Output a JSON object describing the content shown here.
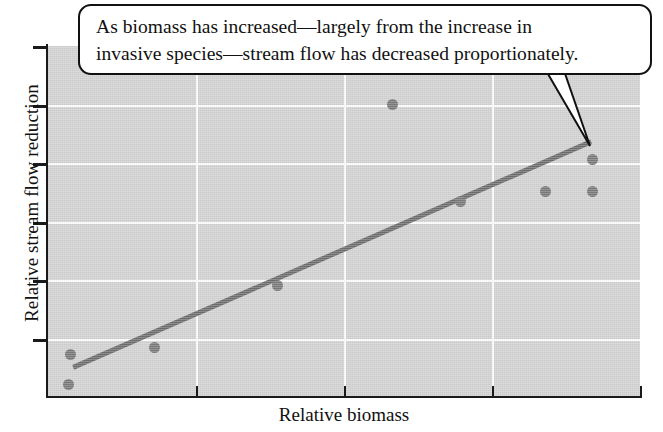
{
  "figure": {
    "callout": {
      "text": "As biomass has increased—largely from the increase in invasive species—stream flow has decreased proportionately.",
      "line1": "As biomass has increased—largely from the increase in",
      "line2": "invasive species—stream flow has decreased proportionately."
    }
  },
  "chart_data": {
    "type": "scatter",
    "title": "",
    "xlabel": "Relative biomass",
    "ylabel": "Relative stream flow reduction",
    "xlim": [
      0,
      4
    ],
    "ylim": [
      0,
      6
    ],
    "grid": true,
    "legend": null,
    "x_tick_values": [
      1,
      2,
      3
    ],
    "y_tick_values": [
      1,
      2,
      3,
      4,
      5
    ],
    "x_tick_labels": [
      "",
      "",
      ""
    ],
    "y_tick_labels": [
      "",
      "",
      "",
      "",
      ""
    ],
    "points": [
      {
        "x": 0.15,
        "y": 0.72
      },
      {
        "x": 0.14,
        "y": 0.19
      },
      {
        "x": 0.72,
        "y": 0.84
      },
      {
        "x": 1.55,
        "y": 1.89
      },
      {
        "x": 2.33,
        "y": 4.99
      },
      {
        "x": 2.79,
        "y": 3.33
      },
      {
        "x": 3.36,
        "y": 3.51
      },
      {
        "x": 3.68,
        "y": 3.51
      },
      {
        "x": 3.68,
        "y": 4.06
      }
    ],
    "trendline": {
      "type": "linear",
      "x_start": 0.17,
      "y_start": 0.49,
      "x_end": 3.67,
      "y_end": 4.36,
      "color": "#6e6e6e"
    },
    "colors": {
      "point": "#7a7a7a",
      "plot_background": "#d2d2d2",
      "gridline": "#fdfdfd",
      "axis": "#1a1a1a",
      "text": "#111111"
    }
  }
}
